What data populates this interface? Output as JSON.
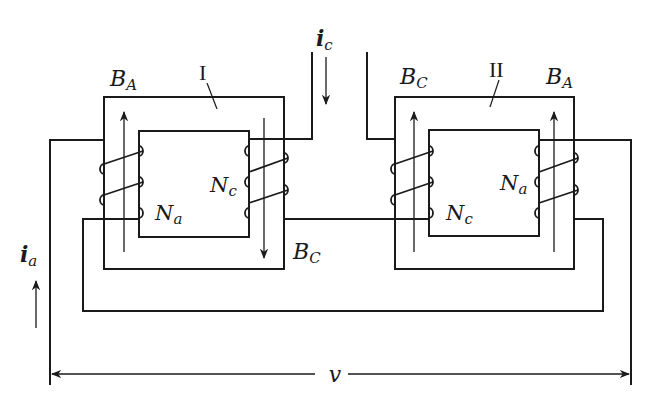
{
  "diagram": {
    "type": "magnetic-amplifier-two-core-schematic",
    "cores": [
      {
        "id": "I",
        "label": "I",
        "flux_left": "B",
        "flux_left_sub": "A",
        "flux_right": "B",
        "flux_right_sub": "C",
        "left_winding": "N",
        "left_winding_sub": "a",
        "right_winding": "N",
        "right_winding_sub": "c"
      },
      {
        "id": "II",
        "label": "II",
        "flux_left": "B",
        "flux_left_sub": "C",
        "flux_right": "B",
        "flux_right_sub": "A",
        "left_winding": "N",
        "left_winding_sub": "c",
        "right_winding": "N",
        "right_winding_sub": "a"
      }
    ],
    "currents": {
      "control": {
        "symbol": "i",
        "sub": "c"
      },
      "ac": {
        "symbol": "i",
        "sub": "a"
      }
    },
    "voltage": {
      "symbol": "v"
    },
    "colors": {
      "line": "#1a1a1a",
      "background": "#ffffff"
    }
  }
}
